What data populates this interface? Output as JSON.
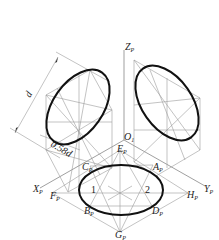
{
  "axes": {
    "z": {
      "label": "Z",
      "sub": "P"
    },
    "x": {
      "label": "X",
      "sub": "P"
    },
    "y": {
      "label": "Y",
      "sub": "P"
    },
    "origin": {
      "label": "O",
      "sub": "1"
    }
  },
  "points": {
    "A": {
      "label": "A",
      "sub": "P"
    },
    "B": {
      "label": "B",
      "sub": "P"
    },
    "C": {
      "label": "C",
      "sub": "P"
    },
    "D": {
      "label": "D",
      "sub": "P"
    },
    "E": {
      "label": "E",
      "sub": "P"
    },
    "F": {
      "label": "F",
      "sub": "P"
    },
    "G": {
      "label": "G",
      "sub": "P"
    },
    "H": {
      "label": "H",
      "sub": "P"
    }
  },
  "centers": {
    "one": "1",
    "two": "2"
  },
  "dimensions": {
    "diameter": "d",
    "minor": "0.58d"
  },
  "colors": {
    "ellipse": "#111111",
    "construction": "#9a9a9a"
  }
}
